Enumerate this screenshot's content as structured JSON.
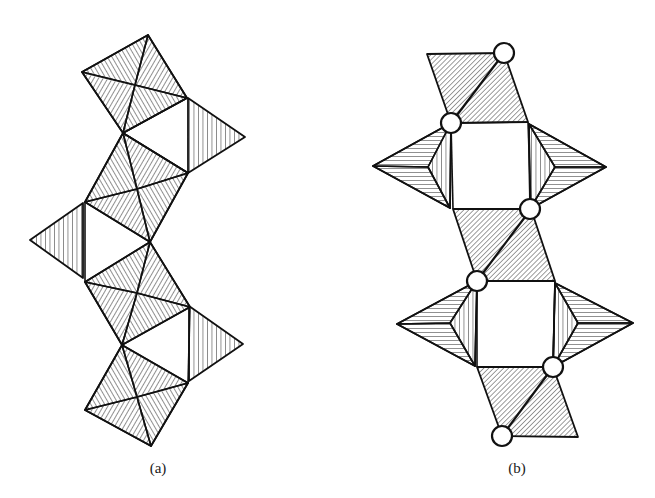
{
  "figure": {
    "panels": [
      {
        "id": "a",
        "label": "(a)",
        "label_pos": [
          158,
          460
        ],
        "description": "Chain of edge-sharing tetrahedra shown as hatched quadrilaterals with alternating side triangles",
        "hatched_quads": [
          {
            "top": [
              148,
              35
            ],
            "left": [
              82,
              72
            ],
            "right": [
              187,
              98
            ],
            "bottom": [
              123,
              133
            ],
            "center": [
              135,
              85
            ]
          },
          {
            "top": [
              123,
              133
            ],
            "left": [
              85,
              202
            ],
            "right": [
              188,
              173
            ],
            "bottom": [
              150,
              242
            ],
            "center": [
              137,
              189
            ]
          },
          {
            "top": [
              150,
              242
            ],
            "left": [
              85,
              282
            ],
            "right": [
              190,
              307
            ],
            "bottom": [
              122,
              345
            ],
            "center": [
              137,
              293
            ]
          },
          {
            "top": [
              122,
              345
            ],
            "left": [
              85,
              410
            ],
            "right": [
              188,
              383
            ],
            "bottom": [
              151,
              446
            ],
            "center": [
              137,
              397
            ]
          }
        ],
        "side_triangles": [
          {
            "points": [
              [
                188,
                98
              ],
              [
                245,
                137
              ],
              [
                188,
                173
              ]
            ],
            "hatch": "vertical"
          },
          {
            "points": [
              [
                83,
                203
              ],
              [
                30,
                240
              ],
              [
                83,
                278
              ]
            ],
            "hatch": "vertical"
          },
          {
            "points": [
              [
                189,
                306
              ],
              [
                243,
                344
              ],
              [
                189,
                381
              ]
            ],
            "hatch": "vertical"
          }
        ]
      },
      {
        "id": "b",
        "label": "(b)",
        "label_pos": [
          517,
          460
        ],
        "description": "Chain of corner-linked units with parallelograms, square rings, side pyramids and open circles at shared vertices",
        "parallelograms": [
          {
            "points": [
              [
                427,
                54
              ],
              [
                504,
                53
              ],
              [
                528,
                122
              ],
              [
                451,
                123
              ]
            ],
            "diagonal": [
              [
                504,
                53
              ],
              [
                451,
                123
              ]
            ]
          },
          {
            "points": [
              [
                453,
                209
              ],
              [
                531,
                209
              ],
              [
                555,
                281
              ],
              [
                477,
                281
              ]
            ],
            "diagonal": [
              [
                531,
                209
              ],
              [
                477,
                281
              ]
            ]
          },
          {
            "points": [
              [
                477,
                367
              ],
              [
                553,
                367
              ],
              [
                578,
                437
              ],
              [
                502,
                436
              ]
            ],
            "diagonal": [
              [
                553,
                367
              ],
              [
                502,
                436
              ]
            ]
          }
        ],
        "side_pyramids": [
          {
            "tip": [
              373,
              166
            ],
            "inner": [
              428,
              167
            ],
            "top": [
              451,
              123
            ],
            "bottom": [
              450,
              208
            ]
          },
          {
            "tip": [
              606,
              167
            ],
            "inner": [
              555,
              167
            ],
            "top": [
              529,
              124
            ],
            "bottom": [
              530,
              209
            ]
          },
          {
            "tip": [
              397,
              324
            ],
            "inner": [
              450,
              323
            ],
            "top": [
              477,
              281
            ],
            "bottom": [
              475,
              366
            ]
          },
          {
            "tip": [
              633,
              323
            ],
            "inner": [
              578,
              323
            ],
            "top": [
              555,
              283
            ],
            "bottom": [
              553,
              367
            ]
          }
        ],
        "circles": [
          {
            "center": [
              504,
              53
            ],
            "r": 10
          },
          {
            "center": [
              451,
              123
            ],
            "r": 10
          },
          {
            "center": [
              530,
              209
            ],
            "r": 10
          },
          {
            "center": [
              477,
              281
            ],
            "r": 10
          },
          {
            "center": [
              553,
              367
            ],
            "r": 10
          },
          {
            "center": [
              502,
              436
            ],
            "r": 10
          }
        ]
      }
    ],
    "colors": {
      "stroke": "#111111",
      "hatch": "#222222",
      "background": "#ffffff",
      "circle_fill": "#ffffff"
    }
  }
}
